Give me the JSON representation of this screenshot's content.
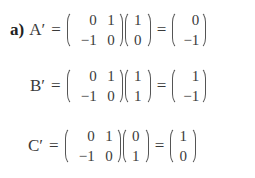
{
  "equations": [
    {
      "label": "a)",
      "lhs": "A′",
      "equals": "=",
      "matrix": [
        "0",
        "1",
        "−1",
        "0"
      ],
      "vector": [
        "1",
        "0"
      ],
      "result": [
        "0",
        "−1"
      ]
    },
    {
      "label": "",
      "lhs": "B′",
      "equals": "=",
      "matrix": [
        "0",
        "1",
        "−1",
        "0"
      ],
      "vector": [
        "1",
        "1"
      ],
      "result": [
        "1",
        "−1"
      ]
    },
    {
      "label": "",
      "lhs": "C′",
      "equals": "=",
      "matrix": [
        "0",
        "1",
        "−1",
        "0"
      ],
      "vector": [
        "0",
        "1"
      ],
      "result": [
        "1",
        "0"
      ]
    }
  ]
}
